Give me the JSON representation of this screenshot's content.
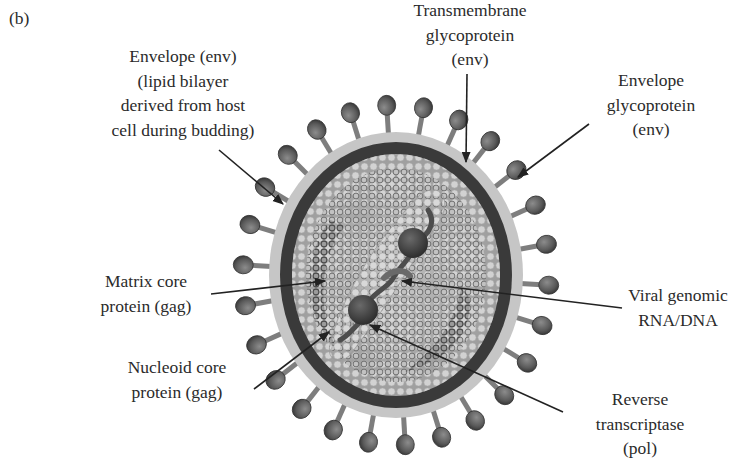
{
  "figure": {
    "panel_letter": "(b)",
    "colors": {
      "background": "#ffffff",
      "halo": "#c4c4c4",
      "envelope_band": "#3a3a3a",
      "matrix_layer": "#a9a9a9",
      "capsid_ring_dark": "#555555",
      "capsid_ring_light": "#cfcfcf",
      "spike_head": "#5f5f5f",
      "spike_stem": "#8a8a8a",
      "text": "#2b2b2b",
      "arrow": "#222222"
    }
  },
  "labels": {
    "envelope": {
      "lines": [
        "Envelope (env)",
        "(lipid bilayer",
        "derived from host",
        "cell during budding)"
      ]
    },
    "transmembrane": {
      "lines": [
        "Transmembrane",
        "glycoprotein",
        "(env)"
      ]
    },
    "envelope_glycoprotein": {
      "lines": [
        "Envelope",
        "glycoprotein",
        "(env)"
      ]
    },
    "matrix": {
      "lines": [
        "Matrix core",
        "protein (gag)"
      ]
    },
    "nucleoid": {
      "lines": [
        "Nucleoid core",
        "protein (gag)"
      ]
    },
    "genome": {
      "lines": [
        "Viral genomic",
        "RNA/DNA"
      ]
    },
    "reverse_transcriptase": {
      "lines": [
        "Reverse",
        "transcriptase",
        "(pol)"
      ]
    }
  }
}
